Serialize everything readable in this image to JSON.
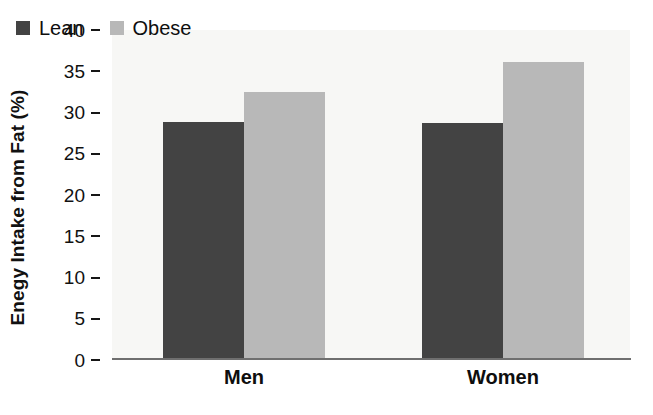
{
  "chart_data": {
    "type": "bar",
    "title": "",
    "subtitle": "",
    "xlabel": "",
    "ylabel": "Enegy Intake from Fat (%)",
    "categories": [
      "Men",
      "Women"
    ],
    "series": [
      {
        "name": "Lean",
        "color": "#434343",
        "values": [
          28.8,
          28.7
        ]
      },
      {
        "name": "Obese",
        "color": "#b8b8b8",
        "values": [
          32.5,
          36.1
        ]
      }
    ],
    "ylim": [
      0,
      40
    ],
    "yticks": [
      0,
      5,
      10,
      15,
      20,
      25,
      30,
      35,
      40
    ],
    "ytick_labels": [
      "0",
      "5",
      "10",
      "15",
      "20",
      "25",
      "30",
      "35",
      "40"
    ],
    "grid": false,
    "legend_position": "upper-left-inside",
    "plot_background": "#f7f7f5",
    "axis_color": "#6f6f6f",
    "text_color": "#111111"
  }
}
